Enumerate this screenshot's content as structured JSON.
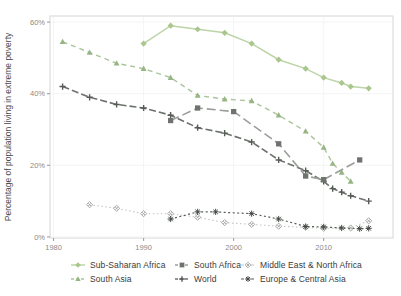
{
  "chart_data": {
    "type": "line",
    "title": "",
    "xlabel": "",
    "ylabel": "Percentage of population living in extreme poverty",
    "x_range": [
      1979.6,
      2017.7
    ],
    "y_range": [
      -0.3,
      61.7
    ],
    "x_ticks": [
      {
        "v": 1980,
        "label": "1980"
      },
      {
        "v": 1990,
        "label": "1990"
      },
      {
        "v": 2000,
        "label": "2000"
      },
      {
        "v": 2010,
        "label": "2010"
      }
    ],
    "y_ticks": [
      {
        "v": 0,
        "label": "0%"
      },
      {
        "v": 20,
        "label": "20%"
      },
      {
        "v": 40,
        "label": "40%"
      },
      {
        "v": 60,
        "label": "60%"
      }
    ],
    "grid": false,
    "legend_position": "bottom",
    "legend_order": [
      "sub_saharan_africa",
      "south_africa",
      "mena",
      "south_asia",
      "world",
      "eca"
    ],
    "draw_order": [
      "mena",
      "eca",
      "south_asia",
      "world",
      "south_africa",
      "sub_saharan_africa"
    ],
    "colors": {
      "panel_border": "#d6d6d6",
      "tick": "#999999",
      "tick_label": "#8a8a8a",
      "axis_title": "#4a4a4a",
      "grid_faint": "#f4f4f4",
      "legend_text": "#3a3a3a"
    },
    "series": [
      {
        "id": "sub_saharan_africa",
        "name": "Sub-Saharan Africa",
        "marker": "diamond",
        "line": "solid",
        "dash": "",
        "width": 1.5,
        "color": "#bcd4a6",
        "marker_color": "#a9c68c",
        "points": [
          [
            1990,
            54
          ],
          [
            1993,
            59
          ],
          [
            1996,
            58
          ],
          [
            1999,
            57
          ],
          [
            2002,
            54
          ],
          [
            2005,
            49.5
          ],
          [
            2008,
            47
          ],
          [
            2010,
            44.5
          ],
          [
            2012,
            43
          ],
          [
            2013,
            42
          ],
          [
            2015,
            41.5
          ]
        ]
      },
      {
        "id": "south_asia",
        "name": "South Asia",
        "marker": "triangle",
        "line": "dashed",
        "dash": "5,4",
        "width": 1.4,
        "color": "#aac49b",
        "marker_color": "#97b584",
        "points": [
          [
            1981,
            54.5
          ],
          [
            1984,
            51.5
          ],
          [
            1987,
            48.5
          ],
          [
            1990,
            47
          ],
          [
            1993,
            44.5
          ],
          [
            1996,
            39.5
          ],
          [
            1999,
            38.5
          ],
          [
            2002,
            38
          ],
          [
            2005,
            34
          ],
          [
            2008,
            29.5
          ],
          [
            2010,
            25
          ],
          [
            2011,
            20.5
          ],
          [
            2012,
            18
          ],
          [
            2013,
            15.5
          ]
        ]
      },
      {
        "id": "world",
        "name": "World",
        "marker": "plus",
        "line": "dashed",
        "dash": "7,3",
        "width": 1.6,
        "color": "#6d726d",
        "marker_color": "#565b56",
        "points": [
          [
            1981,
            42
          ],
          [
            1984,
            39
          ],
          [
            1987,
            37
          ],
          [
            1990,
            36
          ],
          [
            1993,
            34
          ],
          [
            1996,
            30.5
          ],
          [
            1999,
            29
          ],
          [
            2002,
            26.5
          ],
          [
            2005,
            21.5
          ],
          [
            2008,
            18.5
          ],
          [
            2010,
            15.5
          ],
          [
            2011,
            13.5
          ],
          [
            2012,
            12.5
          ],
          [
            2013,
            11.5
          ],
          [
            2015,
            10
          ]
        ]
      },
      {
        "id": "south_africa",
        "name": "South Africa",
        "marker": "square",
        "line": "long-dash",
        "dash": "9,4",
        "width": 1.6,
        "color": "#9b9f9a",
        "marker_color": "#6e736e",
        "points": [
          [
            1993,
            32.5
          ],
          [
            1996,
            36
          ],
          [
            2000,
            35
          ],
          [
            2005,
            26
          ],
          [
            2008,
            17
          ],
          [
            2010,
            16
          ],
          [
            2014,
            21.5
          ]
        ]
      },
      {
        "id": "mena",
        "name": "Middle East & North Africa",
        "marker": "diamond_x",
        "line": "dotted",
        "dash": "1.5,2.5",
        "width": 1.1,
        "color": "#c3c6c1",
        "marker_color": "#9ea29d",
        "points": [
          [
            1984,
            9
          ],
          [
            1987,
            8
          ],
          [
            1990,
            6.5
          ],
          [
            1993,
            6.5
          ],
          [
            1996,
            5.5
          ],
          [
            1999,
            4
          ],
          [
            2002,
            3.5
          ],
          [
            2005,
            3
          ],
          [
            2008,
            2.7
          ],
          [
            2010,
            2.4
          ],
          [
            2013,
            2.5
          ],
          [
            2015,
            4.5
          ]
        ]
      },
      {
        "id": "eca",
        "name": "Europe & Central Asia",
        "marker": "asterisk",
        "line": "dotted",
        "dash": "2,2.5",
        "width": 1.2,
        "color": "#585d58",
        "marker_color": "#464b46",
        "points": [
          [
            1993,
            5
          ],
          [
            1996,
            7
          ],
          [
            1998,
            7
          ],
          [
            2002,
            6.5
          ],
          [
            2005,
            5
          ],
          [
            2008,
            2.9
          ],
          [
            2010,
            2.8
          ],
          [
            2012,
            2.5
          ],
          [
            2014,
            2.3
          ],
          [
            2015,
            2.4
          ]
        ]
      }
    ]
  }
}
